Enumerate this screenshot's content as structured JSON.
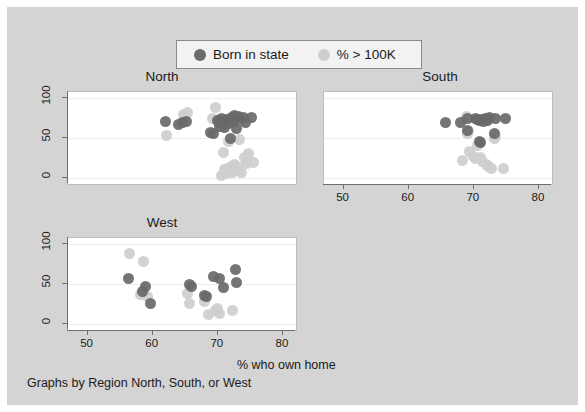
{
  "chart_data": {
    "type": "scatter",
    "title": "",
    "xlabel": "% who own home",
    "ylabel": "",
    "caption": "Graphs by Region North, South, or West",
    "xlim": [
      47,
      82
    ],
    "ylim": [
      -8,
      108
    ],
    "xticks": [
      50,
      60,
      70,
      80
    ],
    "yticks": [
      0,
      50,
      100
    ],
    "grid": true,
    "legend_position": "top-center",
    "legend": [
      {
        "name": "Born in state",
        "color": "#6b6b6b"
      },
      {
        "name": "% > 100K",
        "color": "#cfcfcf"
      }
    ],
    "panels": [
      {
        "name": "North",
        "series": [
          {
            "name": "Born in state",
            "color": "#6b6b6b",
            "points": [
              [
                62.0,
                71
              ],
              [
                64.0,
                67
              ],
              [
                64.6,
                69
              ],
              [
                65.2,
                71
              ],
              [
                68.9,
                57
              ],
              [
                69.4,
                56
              ],
              [
                69.9,
                72
              ],
              [
                70.3,
                70
              ],
              [
                70.6,
                74
              ],
              [
                70.9,
                67
              ],
              [
                71.2,
                73
              ],
              [
                71.6,
                68
              ],
              [
                71.9,
                49
              ],
              [
                72.1,
                76
              ],
              [
                72.4,
                71
              ],
              [
                72.6,
                78
              ],
              [
                72.9,
                62
              ],
              [
                73.2,
                77
              ],
              [
                73.4,
                74
              ],
              [
                73.9,
                76
              ],
              [
                74.3,
                70
              ],
              [
                75.1,
                76
              ],
              [
                71.0,
                63
              ],
              [
                70.2,
                65
              ]
            ]
          },
          {
            "name": "% > 100K",
            "color": "#cfcfcf",
            "points": [
              [
                62.1,
                53
              ],
              [
                64.8,
                80
              ],
              [
                65.4,
                82
              ],
              [
                69.2,
                75
              ],
              [
                69.6,
                88
              ],
              [
                70.4,
                71
              ],
              [
                70.9,
                32
              ],
              [
                71.1,
                10
              ],
              [
                71.3,
                5
              ],
              [
                71.5,
                12
              ],
              [
                71.7,
                45
              ],
              [
                71.9,
                8
              ],
              [
                72.1,
                14
              ],
              [
                72.3,
                6
              ],
              [
                72.6,
                16
              ],
              [
                72.9,
                9
              ],
              [
                73.1,
                13
              ],
              [
                73.4,
                48
              ],
              [
                73.6,
                7
              ],
              [
                74.1,
                25
              ],
              [
                74.4,
                18
              ],
              [
                74.7,
                30
              ],
              [
                75.4,
                19
              ],
              [
                70.6,
                3
              ]
            ]
          }
        ]
      },
      {
        "name": "South",
        "series": [
          {
            "name": "Born in state",
            "color": "#6b6b6b",
            "points": [
              [
                65.6,
                70
              ],
              [
                68.0,
                70
              ],
              [
                69.1,
                75
              ],
              [
                70.2,
                74
              ],
              [
                70.6,
                73
              ],
              [
                70.9,
                72
              ],
              [
                71.2,
                73
              ],
              [
                71.5,
                71
              ],
              [
                71.8,
                74
              ],
              [
                72.1,
                72
              ],
              [
                72.4,
                76
              ],
              [
                73.3,
                75
              ],
              [
                74.8,
                75
              ],
              [
                69.0,
                60
              ],
              [
                71.0,
                44
              ],
              [
                70.8,
                45
              ],
              [
                73.1,
                56
              ]
            ]
          },
          {
            "name": "% > 100K",
            "color": "#cfcfcf",
            "points": [
              [
                68.9,
                77
              ],
              [
                69.0,
                56
              ],
              [
                69.2,
                58
              ],
              [
                69.3,
                33
              ],
              [
                68.2,
                22
              ],
              [
                70.0,
                27
              ],
              [
                70.6,
                40
              ],
              [
                71.0,
                26
              ],
              [
                71.4,
                20
              ],
              [
                71.9,
                17
              ],
              [
                72.3,
                14
              ],
              [
                72.7,
                12
              ],
              [
                73.2,
                50
              ],
              [
                73.3,
                52
              ],
              [
                74.6,
                11
              ],
              [
                70.3,
                24
              ]
            ]
          }
        ]
      },
      {
        "name": "West",
        "series": [
          {
            "name": "Born in state",
            "color": "#6b6b6b",
            "points": [
              [
                56.3,
                57
              ],
              [
                58.4,
                41
              ],
              [
                58.9,
                47
              ],
              [
                59.6,
                25
              ],
              [
                65.6,
                49
              ],
              [
                66.0,
                47
              ],
              [
                68.0,
                35
              ],
              [
                68.3,
                34
              ],
              [
                69.3,
                60
              ],
              [
                70.2,
                57
              ],
              [
                70.9,
                45
              ],
              [
                72.7,
                68
              ],
              [
                72.9,
                52
              ]
            ]
          },
          {
            "name": "% > 100K",
            "color": "#cfcfcf",
            "points": [
              [
                56.4,
                89
              ],
              [
                58.6,
                79
              ],
              [
                58.2,
                37
              ],
              [
                59.2,
                34
              ],
              [
                65.4,
                38
              ],
              [
                65.7,
                25
              ],
              [
                67.9,
                28
              ],
              [
                68.5,
                12
              ],
              [
                70.0,
                19
              ],
              [
                70.3,
                13
              ],
              [
                72.3,
                16
              ],
              [
                69.6,
                16
              ]
            ]
          }
        ]
      }
    ]
  }
}
